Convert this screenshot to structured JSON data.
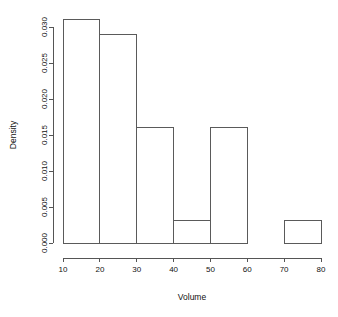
{
  "chart_data": {
    "type": "bar",
    "subtype": "histogram",
    "title": "",
    "xlabel": "Volume",
    "ylabel": "Density",
    "xlim": [
      10,
      80
    ],
    "ylim": [
      0.0,
      0.0315
    ],
    "grid": false,
    "legend": false,
    "bin_width": 10,
    "bin_edges": [
      10,
      20,
      30,
      40,
      50,
      60,
      70,
      80
    ],
    "categories": [
      "10-20",
      "20-30",
      "30-40",
      "40-50",
      "50-60",
      "60-70",
      "70-80"
    ],
    "values": [
      0.0311,
      0.029,
      0.0161,
      0.0032,
      0.0161,
      0.0,
      0.0032
    ],
    "x_ticks": [
      10,
      20,
      30,
      40,
      50,
      60,
      70,
      80
    ],
    "x_tick_labels": [
      "10",
      "20",
      "30",
      "40",
      "50",
      "60",
      "70",
      "80"
    ],
    "y_ticks": [
      0.0,
      0.005,
      0.01,
      0.015,
      0.02,
      0.025,
      0.03
    ],
    "y_tick_labels": [
      "0.000",
      "0.005",
      "0.010",
      "0.015",
      "0.020",
      "0.025",
      "0.030"
    ],
    "colors": {
      "bar_fill": "#ffffff",
      "bar_stroke": "#5a5a5a",
      "axis": "#555555",
      "text": "#111111",
      "background": "#ffffff"
    }
  }
}
